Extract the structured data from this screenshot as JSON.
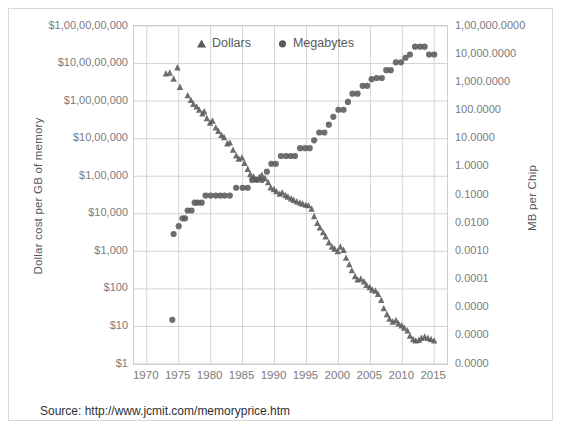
{
  "figure": {
    "source_note": "Source:  http://www.jcmit.com/memoryprice.htm",
    "marker_color": "#5a5a5d",
    "gridline_color": "#d3d3d5",
    "axis_text_color": "#7b7b7e",
    "title_text_color": "#59595c"
  },
  "legend": {
    "items": [
      {
        "label": "Dollars",
        "marker": "triangle-marker"
      },
      {
        "label": "Megabytes",
        "marker": "circle-marker"
      }
    ]
  },
  "axes": {
    "y_left_title": "Dollar cost  per GB of memory",
    "y_right_title": "MB per Chip",
    "x_title": "",
    "y_left_ticks": [
      "$1,00,00,00,000",
      "$10,00,00,000",
      "$1,00,00,000",
      "$10,00,000",
      "$1,00,000",
      "$10,000",
      "$1,000",
      "$100",
      "$10",
      "$1"
    ],
    "y_right_ticks": [
      "1,00,000.0000",
      "10,000.0000",
      "1,000.0000",
      "100.0000",
      "10.0000",
      "1.0000",
      "0.1000",
      "0.0100",
      "0.0010",
      "0.0001",
      "0.0000",
      "0.0000",
      "0.0000"
    ],
    "x_ticks": [
      "1970",
      "1975",
      "1980",
      "1985",
      "1990",
      "1995",
      "2000",
      "2005",
      "2010",
      "2015"
    ]
  },
  "chart_data": {
    "type": "scatter",
    "title": "",
    "subtitle": "",
    "xlabel": "",
    "ylabel": "Dollar cost  per GB of memory",
    "y2label": "MB per Chip",
    "xlim": [
      1968,
      2017
    ],
    "ylim_left_log10": [
      0,
      10
    ],
    "ylim_right_log10": [
      -8,
      5
    ],
    "grid": true,
    "legend_position": "top-center-inside",
    "annotations": [
      "Source:  http://www.jcmit.com/memoryprice.htm"
    ],
    "series": [
      {
        "name": "Dollars",
        "marker": "triangle",
        "color": "#5a5a5d",
        "y_axis": "left",
        "ylabel": "Dollar cost per GB of memory (USD, log scale)",
        "points": [
          [
            1973.0,
            400000000.0
          ],
          [
            1973.6,
            420000000.0
          ],
          [
            1974.2,
            280000000.0
          ],
          [
            1974.8,
            600000000.0
          ],
          [
            1975.2,
            160000000.0
          ],
          [
            1976.4,
            90000000.0
          ],
          [
            1976.9,
            65000000.0
          ],
          [
            1977.3,
            50000000.0
          ],
          [
            1977.8,
            42000000.0
          ],
          [
            1978.2,
            34000000.0
          ],
          [
            1978.7,
            26000000.0
          ],
          [
            1979.0,
            30000000.0
          ],
          [
            1979.4,
            19000000.0
          ],
          [
            1979.9,
            14000000.0
          ],
          [
            1980.3,
            16000000.0
          ],
          [
            1980.8,
            10000000.0
          ],
          [
            1981.2,
            8000000.0
          ],
          [
            1981.7,
            6000000.0
          ],
          [
            1982.1,
            5200000.0
          ],
          [
            1982.6,
            3400000.0
          ],
          [
            1983.0,
            3600000.0
          ],
          [
            1983.5,
            2200000.0
          ],
          [
            1984.0,
            1500000.0
          ],
          [
            1984.4,
            1200000.0
          ],
          [
            1984.9,
            1300000.0
          ],
          [
            1985.3,
            900000.0
          ],
          [
            1985.8,
            600000.0
          ],
          [
            1986.2,
            420000.0
          ],
          [
            1986.7,
            360000.0
          ],
          [
            1987.1,
            300000.0
          ],
          [
            1987.6,
            340000.0
          ],
          [
            1988.0,
            400000.0
          ],
          [
            1988.5,
            320000.0
          ],
          [
            1989.0,
            240000.0
          ],
          [
            1989.4,
            170000.0
          ],
          [
            1989.9,
            150000.0
          ],
          [
            1990.3,
            130000.0
          ],
          [
            1990.8,
            110000.0
          ],
          [
            1991.2,
            120000.0
          ],
          [
            1991.7,
            100000.0
          ],
          [
            1992.1,
            90000.0
          ],
          [
            1992.6,
            80000.0
          ],
          [
            1993.0,
            72000.0
          ],
          [
            1993.5,
            65000.0
          ],
          [
            1994.0,
            60000.0
          ],
          [
            1994.4,
            56000.0
          ],
          [
            1994.9,
            52000.0
          ],
          [
            1995.3,
            50000.0
          ],
          [
            1995.8,
            40000.0
          ],
          [
            1996.2,
            24000.0
          ],
          [
            1996.7,
            15000.0
          ],
          [
            1997.1,
            11000.0
          ],
          [
            1997.6,
            8000.0
          ],
          [
            1998.0,
            6000.0
          ],
          [
            1998.5,
            4000.0
          ],
          [
            1999.0,
            3000.0
          ],
          [
            1999.4,
            2600.0
          ],
          [
            1999.9,
            2200.0
          ],
          [
            2000.3,
            3000.0
          ],
          [
            2000.8,
            2400.0
          ],
          [
            2001.2,
            1400.0
          ],
          [
            2001.7,
            900.0
          ],
          [
            2002.1,
            600.0
          ],
          [
            2002.6,
            400.0
          ],
          [
            2003.0,
            320.0
          ],
          [
            2003.5,
            340.0
          ],
          [
            2004.0,
            280.0
          ],
          [
            2004.4,
            220.0
          ],
          [
            2004.9,
            190.0
          ],
          [
            2005.3,
            160.0
          ],
          [
            2005.8,
            150.0
          ],
          [
            2006.2,
            120.0
          ],
          [
            2006.7,
            80.0
          ],
          [
            2007.1,
            45.0
          ],
          [
            2007.6,
            30.0
          ],
          [
            2008.0,
            22.0
          ],
          [
            2008.5,
            18.0
          ],
          [
            2009.0,
            20.0
          ],
          [
            2009.4,
            16.0
          ],
          [
            2009.9,
            14.0
          ],
          [
            2010.3,
            12.0
          ],
          [
            2010.8,
            10.0
          ],
          [
            2011.2,
            7.0
          ],
          [
            2011.7,
            5.5
          ],
          [
            2012.1,
            5.0
          ],
          [
            2012.6,
            5.2
          ],
          [
            2013.0,
            6.0
          ],
          [
            2013.5,
            6.5
          ],
          [
            2014.0,
            6.0
          ],
          [
            2014.5,
            5.5
          ],
          [
            2015.0,
            5.0
          ]
        ]
      },
      {
        "name": "Megabytes",
        "marker": "circle",
        "color": "#5a5a5d",
        "y_axis": "right",
        "ylabel": "MB per Chip (log scale)",
        "points": [
          [
            1974.0,
            5e-07
          ],
          [
            1974.2,
            0.001
          ],
          [
            1975.0,
            0.002
          ],
          [
            1975.6,
            0.004
          ],
          [
            1976.0,
            0.004
          ],
          [
            1976.4,
            0.008
          ],
          [
            1977.0,
            0.008
          ],
          [
            1977.5,
            0.016
          ],
          [
            1978.0,
            0.016
          ],
          [
            1978.6,
            0.016
          ],
          [
            1979.2,
            0.03
          ],
          [
            1980.0,
            0.03
          ],
          [
            1980.8,
            0.03
          ],
          [
            1981.5,
            0.03
          ],
          [
            1982.2,
            0.03
          ],
          [
            1983.0,
            0.03
          ],
          [
            1984.0,
            0.06
          ],
          [
            1985.0,
            0.06
          ],
          [
            1985.8,
            0.06
          ],
          [
            1986.5,
            0.12
          ],
          [
            1987.2,
            0.12
          ],
          [
            1988.0,
            0.12
          ],
          [
            1988.8,
            0.25
          ],
          [
            1989.5,
            0.5
          ],
          [
            1990.2,
            0.5
          ],
          [
            1991.0,
            1.0
          ],
          [
            1991.8,
            1.0
          ],
          [
            1992.5,
            1.0
          ],
          [
            1993.2,
            1.0
          ],
          [
            1994.0,
            2.0
          ],
          [
            1994.8,
            2.0
          ],
          [
            1995.5,
            2.0
          ],
          [
            1996.2,
            4.0
          ],
          [
            1997.0,
            8.0
          ],
          [
            1997.8,
            8.0
          ],
          [
            1998.5,
            16.0
          ],
          [
            1999.2,
            32.0
          ],
          [
            2000.0,
            60.0
          ],
          [
            2000.8,
            60.0
          ],
          [
            2001.5,
            120.0
          ],
          [
            2002.2,
            250.0
          ],
          [
            2003.0,
            250.0
          ],
          [
            2003.8,
            500.0
          ],
          [
            2004.5,
            500.0
          ],
          [
            2005.2,
            900.0
          ],
          [
            2006.0,
            1000.0
          ],
          [
            2006.8,
            1000.0
          ],
          [
            2007.5,
            2000.0
          ],
          [
            2008.2,
            2000.0
          ],
          [
            2009.0,
            4000.0
          ],
          [
            2009.8,
            4000.0
          ],
          [
            2010.5,
            6000.0
          ],
          [
            2011.2,
            8000.0
          ],
          [
            2012.0,
            16000.0
          ],
          [
            2012.8,
            16000.0
          ],
          [
            2013.5,
            16000.0
          ],
          [
            2014.2,
            8000.0
          ],
          [
            2015.0,
            8000.0
          ]
        ]
      }
    ]
  }
}
